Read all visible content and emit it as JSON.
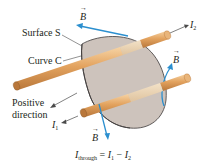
{
  "diagram": {
    "labels": {
      "surface": "Surface S",
      "curve": "Curve C",
      "positive_line1": "Positive",
      "positive_line2": "direction",
      "b_field": "B",
      "i1": "I",
      "i1_sub": "1",
      "i2": "I",
      "i2_sub": "2",
      "equation_lhs": "I",
      "equation_lhs_sub": "through",
      "equation_eq": " = ",
      "equation_i1": "I",
      "equation_i1_sub": "1",
      "equation_minus": " − ",
      "equation_i2": "I",
      "equation_i2_sub": "2"
    },
    "colors": {
      "surface_fill": "#cdc3bc",
      "surface_edge": "#3d3a3a",
      "rod_fill": "#e3a35f",
      "rod_highlight": "#f3cf9f",
      "rod_shadow": "#b9773a",
      "rod_inside_fill": "#ecd4b4",
      "b_field": "#2b8fcf",
      "leader_line": "#4a4a4a",
      "text": "#231f20"
    },
    "elements": [
      {
        "name": "surface-s",
        "type": "shaded-surface"
      },
      {
        "name": "curve-c",
        "type": "boundary-curve"
      },
      {
        "name": "wire-1",
        "type": "current-carrying-rod",
        "current": "I1",
        "direction": "toward viewer (lower-left)"
      },
      {
        "name": "wire-2",
        "type": "current-carrying-rod",
        "current": "I2",
        "direction": "away (upper-right)"
      },
      {
        "name": "b-field-arrows",
        "type": "field-vectors",
        "count": 3
      }
    ]
  }
}
